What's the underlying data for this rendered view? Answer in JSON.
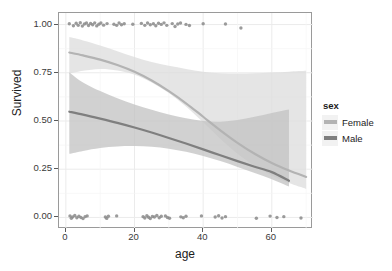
{
  "chart_data": {
    "type": "line",
    "title": "",
    "xlabel": "age",
    "ylabel": "Survived",
    "xlim": [
      -2,
      72
    ],
    "ylim": [
      -0.06,
      1.06
    ],
    "grid": true,
    "legend_position": "right",
    "legend_title": "sex",
    "xticks": [
      0,
      20,
      40,
      60
    ],
    "xticklabels": [
      "0",
      "20",
      "40",
      "60"
    ],
    "yticks": [
      0.0,
      0.25,
      0.5,
      0.75,
      1.0
    ],
    "yticklabels": [
      "0.00",
      "0.25",
      "0.50",
      "0.75",
      "1.00"
    ],
    "series": [
      {
        "name": "Female",
        "color": "#b3b3b3",
        "band_color": "#dcdcdc",
        "x": [
          1,
          5,
          10,
          15,
          20,
          25,
          30,
          35,
          40,
          45,
          50,
          55,
          60,
          65,
          70
        ],
        "values": [
          0.855,
          0.84,
          0.818,
          0.79,
          0.755,
          0.71,
          0.655,
          0.592,
          0.522,
          0.452,
          0.387,
          0.33,
          0.282,
          0.243,
          0.21
        ],
        "ci_lower": [
          0.745,
          0.76,
          0.77,
          0.762,
          0.74,
          0.7,
          0.645,
          0.575,
          0.493,
          0.408,
          0.33,
          0.268,
          0.218,
          0.178,
          0.148
        ],
        "ci_upper": [
          0.935,
          0.918,
          0.892,
          0.862,
          0.832,
          0.806,
          0.786,
          0.77,
          0.756,
          0.748,
          0.746,
          0.748,
          0.752,
          0.756,
          0.76
        ]
      },
      {
        "name": "Male",
        "color": "#7f7f7f",
        "band_color": "#c2c2c2",
        "x": [
          1,
          5,
          10,
          15,
          20,
          25,
          30,
          35,
          40,
          45,
          50,
          55,
          60,
          65
        ],
        "values": [
          0.548,
          0.533,
          0.512,
          0.49,
          0.466,
          0.44,
          0.412,
          0.383,
          0.353,
          0.322,
          0.292,
          0.263,
          0.235,
          0.19
        ],
        "ci_lower": [
          0.33,
          0.345,
          0.36,
          0.368,
          0.37,
          0.366,
          0.356,
          0.34,
          0.318,
          0.292,
          0.262,
          0.23,
          0.198,
          0.16
        ],
        "ci_upper": [
          0.752,
          0.7,
          0.655,
          0.618,
          0.586,
          0.558,
          0.534,
          0.514,
          0.5,
          0.496,
          0.505,
          0.522,
          0.542,
          0.56
        ]
      }
    ],
    "scatter": {
      "color": "#8a8a8a",
      "points_top": [
        [
          1.0,
          1.004
        ],
        [
          2.2,
          0.994
        ],
        [
          3.0,
          1.007
        ],
        [
          3.6,
          0.996
        ],
        [
          4.2,
          1.01
        ],
        [
          4.8,
          0.992
        ],
        [
          5.4,
          1.003
        ],
        [
          6.0,
          1.008
        ],
        [
          6.6,
          0.995
        ],
        [
          7.2,
          1.006
        ],
        [
          7.8,
          0.999
        ],
        [
          8.4,
          1.009
        ],
        [
          9.0,
          0.993
        ],
        [
          9.6,
          1.002
        ],
        [
          10.2,
          1.008
        ],
        [
          11.0,
          0.997
        ],
        [
          12.0,
          1.005
        ],
        [
          14.0,
          1.002
        ],
        [
          14.8,
          0.996
        ],
        [
          15.5,
          1.008
        ],
        [
          16.2,
          0.999
        ],
        [
          17.0,
          1.004
        ],
        [
          19.5,
          1.002
        ],
        [
          22.0,
          1.006
        ],
        [
          23.0,
          0.996
        ],
        [
          23.8,
          1.008
        ],
        [
          24.6,
          0.999
        ],
        [
          25.5,
          1.004
        ],
        [
          26.2,
          0.994
        ],
        [
          27.0,
          1.007
        ],
        [
          27.8,
          1.001
        ],
        [
          28.6,
          1.009
        ],
        [
          29.4,
          0.996
        ],
        [
          31.0,
          1.005
        ],
        [
          31.8,
          0.99
        ],
        [
          32.6,
          1.003
        ],
        [
          33.4,
          1.008
        ],
        [
          35.0,
          1.001
        ],
        [
          36.0,
          0.995
        ],
        [
          40.0,
          1.004
        ],
        [
          46.5,
          1.003
        ],
        [
          51.0,
          0.982
        ]
      ],
      "points_bottom": [
        [
          1.2,
          0.008
        ],
        [
          1.6,
          -0.004
        ],
        [
          2.0,
          0.003
        ],
        [
          2.6,
          0.01
        ],
        [
          3.2,
          -0.002
        ],
        [
          3.8,
          0.006
        ],
        [
          4.4,
          0.0
        ],
        [
          5.0,
          -0.006
        ],
        [
          5.6,
          0.004
        ],
        [
          6.2,
          0.008
        ],
        [
          11.5,
          0.002
        ],
        [
          11.9,
          -0.005
        ],
        [
          12.4,
          0.006
        ],
        [
          14.8,
          0.008
        ],
        [
          22.5,
          0.004
        ],
        [
          23.0,
          -0.003
        ],
        [
          23.6,
          0.009
        ],
        [
          24.1,
          0.001
        ],
        [
          24.6,
          -0.006
        ],
        [
          25.2,
          0.005
        ],
        [
          25.8,
          0.002
        ],
        [
          26.5,
          0.01
        ],
        [
          27.2,
          -0.002
        ],
        [
          27.8,
          0.006
        ],
        [
          29.0,
          0.008
        ],
        [
          29.6,
          0.0
        ],
        [
          30.2,
          -0.004
        ],
        [
          33.5,
          0.003
        ],
        [
          34.2,
          -0.002
        ],
        [
          35.0,
          0.006
        ],
        [
          39.5,
          0.008
        ],
        [
          43.5,
          0.002
        ],
        [
          44.5,
          0.009
        ],
        [
          45.5,
          -0.003
        ],
        [
          46.5,
          0.004
        ],
        [
          55.5,
          -0.004
        ],
        [
          59.5,
          0.007
        ],
        [
          61.5,
          0.0
        ],
        [
          63.5,
          0.004
        ],
        [
          68.5,
          -0.003
        ]
      ]
    }
  },
  "legend": {
    "title": "sex",
    "items": [
      {
        "label": "Female",
        "color": "#b3b3b3"
      },
      {
        "label": "Male",
        "color": "#7f7f7f"
      }
    ]
  },
  "axes": {
    "x_title": "age",
    "y_title": "Survived"
  }
}
